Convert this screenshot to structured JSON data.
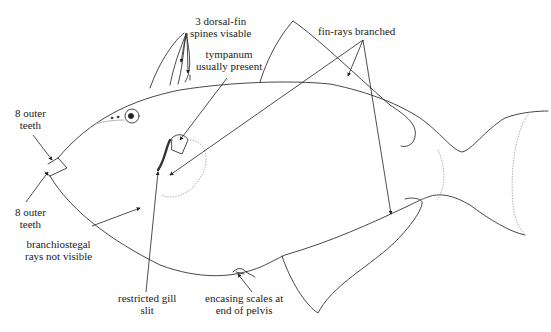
{
  "diagram": {
    "colors": {
      "outline": "#333333",
      "faint": "#9a9a9a",
      "text": "#222222",
      "background": "#ffffff"
    }
  },
  "labels": {
    "dorsal_spines": "3 dorsal-fin\nspines visable",
    "tympanum": "tympanum\nusually present",
    "fin_rays": "fin-rays branched",
    "outer_teeth_upper": "8 outer\nteeth",
    "outer_teeth_lower": "8 outer\nteeth",
    "branchiostegal": "branchiostegal\nrays not visible",
    "gill_slit": "restricted gill\nslit",
    "pelvis_scales": "encasing scales at\nend of pelvis"
  }
}
